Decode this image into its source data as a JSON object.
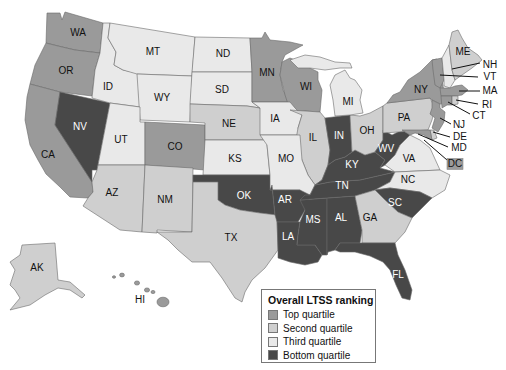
{
  "legend": {
    "title": "Overall LTSS ranking",
    "items": [
      {
        "key": "top",
        "label": "Top quartile",
        "color": "#9a9a9a"
      },
      {
        "key": "second",
        "label": "Second quartile",
        "color": "#cfcfcf"
      },
      {
        "key": "third",
        "label": "Third quartile",
        "color": "#e9e9e9"
      },
      {
        "key": "bottom",
        "label": "Bottom quartile",
        "color": "#484848"
      }
    ]
  },
  "label_colors": {
    "light_fill_text": "#111111",
    "dark_fill_text": "#ffffff"
  },
  "states": [
    {
      "abbr": "WA",
      "quartile": "top"
    },
    {
      "abbr": "OR",
      "quartile": "top"
    },
    {
      "abbr": "CA",
      "quartile": "top"
    },
    {
      "abbr": "NV",
      "quartile": "bottom"
    },
    {
      "abbr": "ID",
      "quartile": "third"
    },
    {
      "abbr": "MT",
      "quartile": "third"
    },
    {
      "abbr": "WY",
      "quartile": "third"
    },
    {
      "abbr": "UT",
      "quartile": "third"
    },
    {
      "abbr": "AZ",
      "quartile": "second"
    },
    {
      "abbr": "CO",
      "quartile": "top"
    },
    {
      "abbr": "NM",
      "quartile": "second"
    },
    {
      "abbr": "ND",
      "quartile": "third"
    },
    {
      "abbr": "SD",
      "quartile": "third"
    },
    {
      "abbr": "NE",
      "quartile": "second"
    },
    {
      "abbr": "KS",
      "quartile": "third"
    },
    {
      "abbr": "OK",
      "quartile": "bottom"
    },
    {
      "abbr": "TX",
      "quartile": "second"
    },
    {
      "abbr": "MN",
      "quartile": "top"
    },
    {
      "abbr": "WI",
      "quartile": "top"
    },
    {
      "abbr": "IA",
      "quartile": "third"
    },
    {
      "abbr": "IL",
      "quartile": "second"
    },
    {
      "abbr": "MO",
      "quartile": "third"
    },
    {
      "abbr": "AR",
      "quartile": "bottom"
    },
    {
      "abbr": "LA",
      "quartile": "bottom"
    },
    {
      "abbr": "MS",
      "quartile": "bottom"
    },
    {
      "abbr": "AL",
      "quartile": "bottom"
    },
    {
      "abbr": "TN",
      "quartile": "bottom"
    },
    {
      "abbr": "KY",
      "quartile": "bottom"
    },
    {
      "abbr": "IN",
      "quartile": "bottom"
    },
    {
      "abbr": "OH",
      "quartile": "second"
    },
    {
      "abbr": "MI",
      "quartile": "third"
    },
    {
      "abbr": "WV",
      "quartile": "bottom"
    },
    {
      "abbr": "VA",
      "quartile": "third"
    },
    {
      "abbr": "NC",
      "quartile": "third"
    },
    {
      "abbr": "SC",
      "quartile": "bottom"
    },
    {
      "abbr": "GA",
      "quartile": "second"
    },
    {
      "abbr": "FL",
      "quartile": "bottom"
    },
    {
      "abbr": "PA",
      "quartile": "second"
    },
    {
      "abbr": "NY",
      "quartile": "top"
    },
    {
      "abbr": "VT",
      "quartile": "top"
    },
    {
      "abbr": "NH",
      "quartile": "third"
    },
    {
      "abbr": "ME",
      "quartile": "second"
    },
    {
      "abbr": "MA",
      "quartile": "top"
    },
    {
      "abbr": "CT",
      "quartile": "top"
    },
    {
      "abbr": "RI",
      "quartile": "second"
    },
    {
      "abbr": "NJ",
      "quartile": "top"
    },
    {
      "abbr": "DE",
      "quartile": "second"
    },
    {
      "abbr": "MD",
      "quartile": "top"
    },
    {
      "abbr": "DC",
      "quartile": "top"
    },
    {
      "abbr": "AK",
      "quartile": "second"
    },
    {
      "abbr": "HI",
      "quartile": "top"
    }
  ]
}
